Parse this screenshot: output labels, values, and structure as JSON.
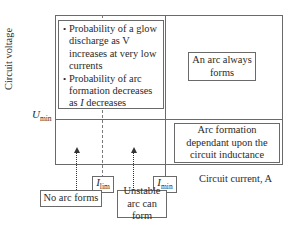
{
  "diagram": {
    "axes": {
      "y_label": "Circuit voltage",
      "x_label": "Circuit current, A",
      "u_min": {
        "symbol": "U",
        "subscript": "min"
      }
    },
    "regions": {
      "low_current_high_voltage": {
        "bullets": [
          "Probability of a glow discharge as V increases at very low currents",
          "Probability of arc formation decreases as I decreases"
        ]
      },
      "high_current_high_voltage": {
        "text": "An arc always forms"
      },
      "high_current_low_voltage": {
        "text": "Arc formation dependant upon the circuit inductance"
      }
    },
    "markers": {
      "i_lim": {
        "symbol": "I",
        "subscript": "lim"
      },
      "i_min": {
        "symbol": "I",
        "subscript": "min"
      }
    },
    "callouts": {
      "no_arc": "No arc forms",
      "unstable_arc": "Unstable arc can form"
    },
    "colors": {
      "line": "#6a6a6a",
      "text": "#2a2a2a",
      "background": "#ffffff"
    }
  }
}
